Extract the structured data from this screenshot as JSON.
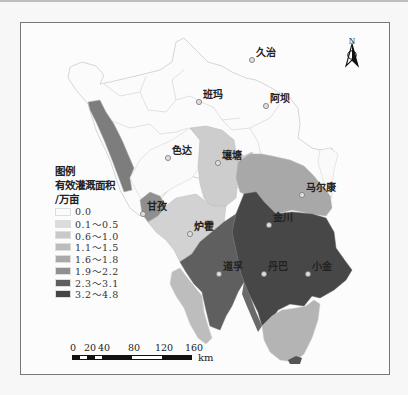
{
  "legend": {
    "title": "图例",
    "subtitle": "有效灌溉面积",
    "unit": "/万亩",
    "classes": [
      {
        "label": "0.0",
        "color": "#fbfbfb"
      },
      {
        "label": "0.1～0.5",
        "color": "#dcdcdc"
      },
      {
        "label": "0.6～1.0",
        "color": "#c9c9c9"
      },
      {
        "label": "1.1～1.5",
        "color": "#bcbcbc"
      },
      {
        "label": "1.6～1.8",
        "color": "#a9a9a9"
      },
      {
        "label": "1.9～2.2",
        "color": "#8f8f8f"
      },
      {
        "label": "2.3～3.1",
        "color": "#5e5e5e"
      },
      {
        "label": "3.2～4.8",
        "color": "#454545"
      }
    ]
  },
  "north_arrow": {
    "label": "N"
  },
  "scale_bar": {
    "ticks": [
      "0",
      "20",
      "40",
      "80",
      "120",
      "160"
    ],
    "unit": "km"
  },
  "places": [
    {
      "name": "久治",
      "x": 252,
      "y": 60
    },
    {
      "name": "班玛",
      "x": 199,
      "y": 102
    },
    {
      "name": "阿坝",
      "x": 266,
      "y": 106
    },
    {
      "name": "色达",
      "x": 168,
      "y": 158
    },
    {
      "name": "壤塘",
      "x": 218,
      "y": 163
    },
    {
      "name": "马尔康",
      "x": 302,
      "y": 195
    },
    {
      "name": "甘孜",
      "x": 143,
      "y": 214
    },
    {
      "name": "金川",
      "x": 269,
      "y": 225
    },
    {
      "name": "炉霍",
      "x": 190,
      "y": 234
    },
    {
      "name": "道孚",
      "x": 219,
      "y": 274
    },
    {
      "name": "丹巴",
      "x": 264,
      "y": 274
    },
    {
      "name": "小金",
      "x": 308,
      "y": 274
    }
  ]
}
